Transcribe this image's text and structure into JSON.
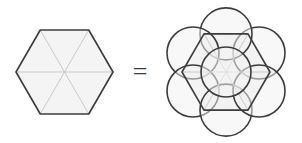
{
  "diagram": {
    "operator_label": "=",
    "colors": {
      "background": "#ffffff",
      "outline_dark": "#3c3c3c",
      "spoke_light": "#c9c9c9",
      "fill_light": "#f4f4f4",
      "fill_circle": "#f2f2f2"
    },
    "left_figure": {
      "name": "hexagon-with-six-triangles",
      "shape": "hexagon",
      "orientation": "flat-top",
      "center": [
        64.5,
        72
      ],
      "circumradius": 48.5,
      "vertices": [
        [
          113,
          72
        ],
        [
          88.75,
          30
        ],
        [
          40.25,
          30
        ],
        [
          16,
          72
        ],
        [
          40.25,
          114
        ],
        [
          88.75,
          114
        ]
      ],
      "internal_spokes": 6,
      "triangle_count": 6,
      "outline_width": 1.6,
      "spoke_width": 1.0
    },
    "right_figure": {
      "name": "hexagon-with-seven-circles",
      "shape": "hexagon",
      "orientation": "flat-top",
      "center": [
        226,
        72
      ],
      "circumradius": 44,
      "vertices": [
        [
          270,
          72
        ],
        [
          248,
          33.9
        ],
        [
          204,
          33.9
        ],
        [
          182,
          72
        ],
        [
          204,
          110.1
        ],
        [
          248,
          110.1
        ]
      ],
      "internal_spokes": 6,
      "edge_circles": {
        "count": 6,
        "radius": 26,
        "centers": [
          [
            259,
            52.95
          ],
          [
            226,
            33.9
          ],
          [
            193,
            52.95
          ],
          [
            193,
            91.05
          ],
          [
            226,
            110.1
          ],
          [
            259,
            91.05
          ]
        ]
      },
      "center_circle": {
        "count": 1,
        "radius": 25,
        "center": [
          226,
          72
        ]
      },
      "total_circles": 7,
      "outline_width": 1.6,
      "spoke_width": 1.0
    }
  }
}
